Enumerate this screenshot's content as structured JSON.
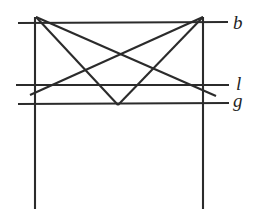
{
  "figure": {
    "background_color": "#ffffff",
    "stroke_color": "#2b2b2b",
    "labels": {
      "b": "b",
      "l": "l",
      "g": "g"
    },
    "lines": [
      {
        "name": "vertical-line-left",
        "x1": 35,
        "y1": 17,
        "x2": 35,
        "y2": 209
      },
      {
        "name": "vertical-line-right",
        "x1": 203,
        "y1": 17,
        "x2": 203,
        "y2": 209
      },
      {
        "name": "horizontal-line-l",
        "x1": 16,
        "y1": 85,
        "x2": 229,
        "y2": 85
      },
      {
        "name": "line-b",
        "x1": 18,
        "y1": 23,
        "x2": 228,
        "y2": 22
      },
      {
        "name": "line-g",
        "x1": 18,
        "y1": 104,
        "x2": 229,
        "y2": 103
      },
      {
        "name": "diagonal-left-apex-to-lower-right",
        "x1": 36,
        "y1": 17,
        "x2": 216,
        "y2": 96
      },
      {
        "name": "diagonal-right-apex-to-lower-left",
        "x1": 203,
        "y1": 17,
        "x2": 30,
        "y2": 95
      },
      {
        "name": "vee-left-arm",
        "x1": 36,
        "y1": 17,
        "x2": 118,
        "y2": 105
      },
      {
        "name": "vee-right-arm",
        "x1": 118,
        "y1": 105,
        "x2": 203,
        "y2": 17
      }
    ]
  }
}
